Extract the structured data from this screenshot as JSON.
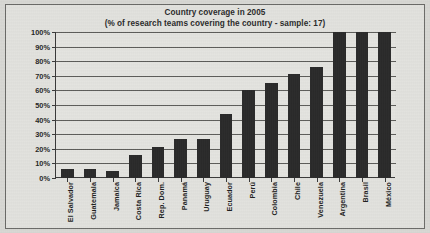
{
  "figure": {
    "title_line1": "Country coverage in 2005",
    "title_line2": "(% of research teams covering the country - sample: 17)"
  },
  "chart_data": {
    "type": "bar",
    "title": "Country coverage in 2005",
    "subtitle": "(% of research teams covering the country - sample: 17)",
    "xlabel": "",
    "ylabel": "",
    "ylim": [
      0,
      100
    ],
    "grid": true,
    "legend": "none",
    "bar_color": "#2a2a2a",
    "plot_background": "#e4e4e0",
    "ytick_labels": [
      "0%",
      "10%",
      "20%",
      "30%",
      "40%",
      "50%",
      "60%",
      "70%",
      "80%",
      "90%",
      "100%"
    ],
    "ytick_values": [
      0,
      10,
      20,
      30,
      40,
      50,
      60,
      70,
      80,
      90,
      100
    ],
    "categories": [
      "El Salvador",
      "Guatemala",
      "Jamaica",
      "Costa Rica",
      "Rep. Dom.",
      "Panamá",
      "Uruguay",
      "Ecuador",
      "Perú",
      "Colombia",
      "Chile",
      "Venezuela",
      "Argentina",
      "Brasil",
      "México"
    ],
    "values": [
      6,
      6,
      5,
      16,
      21,
      27,
      27,
      44,
      60,
      65,
      71,
      76,
      100,
      100,
      100
    ],
    "unit": "%"
  }
}
